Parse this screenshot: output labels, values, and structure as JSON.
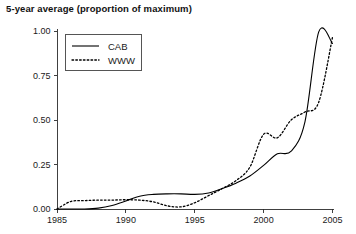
{
  "chart_data": {
    "type": "line",
    "title": "5-year average (proportion of maximum)",
    "xlabel": "",
    "ylabel": "",
    "xlim": [
      1985,
      2005
    ],
    "ylim": [
      0.0,
      1.0
    ],
    "grid": false,
    "legend_position": "top-left",
    "x_ticks": [
      "1985",
      "1990",
      "1995",
      "2000",
      "2005"
    ],
    "x_tick_values": [
      1985,
      1990,
      1995,
      2000,
      2005
    ],
    "y_ticks": [
      "0.00",
      "0.25",
      "0.50",
      "0.75",
      "1.00"
    ],
    "y_tick_values": [
      0.0,
      0.25,
      0.5,
      0.75,
      1.0
    ],
    "x": [
      1985,
      1986,
      1987,
      1988,
      1989,
      1990,
      1991,
      1992,
      1993,
      1994,
      1995,
      1996,
      1997,
      1998,
      1999,
      2000,
      2001,
      2002,
      2003,
      2004,
      2005
    ],
    "series": [
      {
        "name": "CAB",
        "style": "solid",
        "color": "#000000",
        "values": [
          0.0,
          0.0,
          0.0,
          0.005,
          0.02,
          0.045,
          0.072,
          0.082,
          0.085,
          0.085,
          0.082,
          0.09,
          0.115,
          0.145,
          0.185,
          0.245,
          0.31,
          0.325,
          0.49,
          0.995,
          0.93
        ]
      },
      {
        "name": "WWW",
        "style": "dotted",
        "color": "#000000",
        "values": [
          0.0,
          0.042,
          0.047,
          0.05,
          0.05,
          0.052,
          0.05,
          0.04,
          0.018,
          0.012,
          0.035,
          0.075,
          0.115,
          0.16,
          0.235,
          0.42,
          0.4,
          0.5,
          0.545,
          0.6,
          0.965
        ]
      }
    ]
  }
}
